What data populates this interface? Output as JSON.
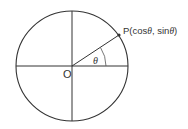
{
  "diagram": {
    "origin_label": "O",
    "point_label_prefix": "P(cos",
    "point_label_theta1": "θ",
    "point_label_mid": ", sin",
    "point_label_theta2": "θ",
    "point_label_suffix": ")",
    "angle_label": "θ",
    "colors": {
      "stroke": "#333333",
      "background": "#ffffff"
    }
  }
}
